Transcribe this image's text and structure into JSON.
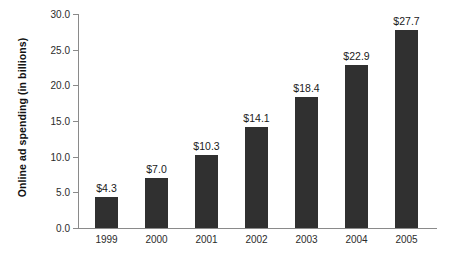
{
  "chart_data": {
    "type": "bar",
    "title": "",
    "xlabel": "",
    "ylabel": "Online ad spending (in billions)",
    "categories": [
      "1999",
      "2000",
      "2001",
      "2002",
      "2003",
      "2004",
      "2005"
    ],
    "values": [
      4.3,
      7.0,
      10.3,
      14.1,
      18.4,
      22.9,
      27.7
    ],
    "data_labels": [
      "$4.3",
      "$7.0",
      "$10.3",
      "$14.1",
      "$18.4",
      "$22.9",
      "$27.7"
    ],
    "ylim": [
      0.0,
      30.0
    ],
    "ytick_values": [
      0.0,
      5.0,
      10.0,
      15.0,
      20.0,
      25.0,
      30.0
    ],
    "ytick_labels": [
      "0.0",
      "5.0",
      "10.0",
      "15.0",
      "20.0",
      "25.0",
      "30.0"
    ],
    "grid": false,
    "legend": false,
    "legend_position": "none",
    "bar_color": "#303030",
    "axis_color": "#8a8a8a",
    "background_color": "#ffffff",
    "text_color": "#1a1a1a"
  }
}
